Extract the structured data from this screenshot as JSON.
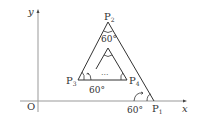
{
  "diagram": {
    "axes": {
      "x_label": "x",
      "y_label": "y",
      "origin_label": "O"
    },
    "points": {
      "P1": {
        "label": "P",
        "sub": "1"
      },
      "P2": {
        "label": "P",
        "sub": "2"
      },
      "P3": {
        "label": "P",
        "sub": "3"
      },
      "P4": {
        "label": "P",
        "sub": "4"
      }
    },
    "angles": {
      "apex": "60°",
      "p3": "60°",
      "p1": "60°"
    },
    "ellipsis": "···",
    "colors": {
      "line": "#333333",
      "axis": "#888888",
      "background": "#ffffff"
    }
  }
}
